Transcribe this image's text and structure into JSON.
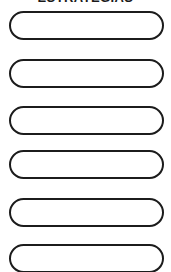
{
  "page": {
    "title": "ESTRATEGIAS",
    "background_color": "#ffffff",
    "ink_color": "#1c1c1c",
    "width": 171,
    "height": 272
  },
  "fields": [
    {
      "index": 1,
      "value": "",
      "placeholder": ""
    },
    {
      "index": 2,
      "value": "",
      "placeholder": ""
    },
    {
      "index": 3,
      "value": "",
      "placeholder": ""
    },
    {
      "index": 4,
      "value": "",
      "placeholder": ""
    },
    {
      "index": 5,
      "value": "",
      "placeholder": ""
    },
    {
      "index": 6,
      "value": "",
      "placeholder": ""
    }
  ]
}
